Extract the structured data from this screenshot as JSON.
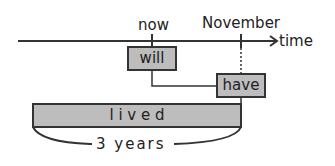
{
  "timeline": {
    "axis_label": "time",
    "markers": [
      {
        "label": "now"
      },
      {
        "label": "November"
      }
    ]
  },
  "boxes": {
    "will": "will",
    "have": "have",
    "lived": "l i v e d"
  },
  "span_label": "3 years",
  "colors": {
    "box_fill": "#bdbdbd",
    "line": "#333333"
  }
}
